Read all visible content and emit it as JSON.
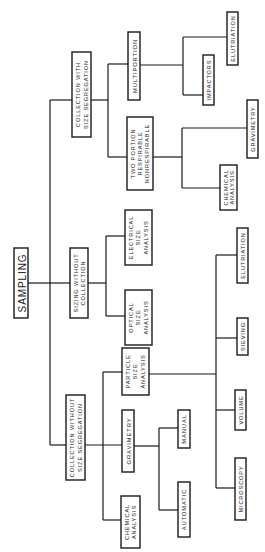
{
  "diagram": {
    "type": "tree",
    "orientation": "rotated-90-ccw",
    "root": "SAMPLING",
    "nodes": {
      "sampling": {
        "lines": [
          "SAMPLING"
        ]
      },
      "coll_with_seg": {
        "lines": [
          "COLLECTION WITH",
          "SIZE SEGREGATION"
        ]
      },
      "sizing_without_coll": {
        "lines": [
          "SIZING WITHOUT",
          "COLLECTION"
        ]
      },
      "coll_without_seg": {
        "lines": [
          "COLLECTION WITHOUT",
          "SIZE SEGREGATION"
        ]
      },
      "multiportion": {
        "lines": [
          "MULTIPORTION"
        ]
      },
      "two_portion": {
        "lines": [
          "TWO PORTION",
          "RESPIRABLE",
          "NONRESPIRABLE"
        ]
      },
      "impactors": {
        "lines": [
          "IMPACTORS"
        ]
      },
      "elutriation_top": {
        "lines": [
          "ELUTRIATION"
        ]
      },
      "gravimetry_right": {
        "lines": [
          "GRAVIMETRY"
        ]
      },
      "chemical_right": {
        "lines": [
          "CHEMICAL",
          "ANALYSIS"
        ]
      },
      "electrical": {
        "lines": [
          "ELECTRICAL",
          "SIZE",
          "ANALYSIS"
        ]
      },
      "optical": {
        "lines": [
          "OPTICAL",
          "SIZE",
          "ANALYSIS"
        ]
      },
      "particle_size": {
        "lines": [
          "PARTICLE",
          "SIZE",
          "ANALYSIS"
        ]
      },
      "gravimetry_left": {
        "lines": [
          "GRAVIMETRY"
        ]
      },
      "chemical_left": {
        "lines": [
          "CHEMICAL",
          "ANALYSIS"
        ]
      },
      "elutriation_low": {
        "lines": [
          "ELUTRIATION"
        ]
      },
      "sieving": {
        "lines": [
          "SIEVING"
        ]
      },
      "volume": {
        "lines": [
          "VOLUME"
        ]
      },
      "microscopy": {
        "lines": [
          "MICROSCOPY"
        ]
      },
      "manual": {
        "lines": [
          "MANUAL"
        ]
      },
      "automatic": {
        "lines": [
          "AUTOMATIC"
        ]
      }
    },
    "edges": [
      [
        "sampling",
        "coll_with_seg"
      ],
      [
        "sampling",
        "sizing_without_coll"
      ],
      [
        "sampling",
        "coll_without_seg"
      ],
      [
        "coll_with_seg",
        "multiportion"
      ],
      [
        "coll_with_seg",
        "two_portion"
      ],
      [
        "multiportion",
        "impactors"
      ],
      [
        "multiportion",
        "elutriation_top"
      ],
      [
        "two_portion",
        "gravimetry_right"
      ],
      [
        "two_portion",
        "chemical_right"
      ],
      [
        "sizing_without_coll",
        "electrical"
      ],
      [
        "sizing_without_coll",
        "optical"
      ],
      [
        "coll_without_seg",
        "particle_size"
      ],
      [
        "coll_without_seg",
        "gravimetry_left"
      ],
      [
        "coll_without_seg",
        "chemical_left"
      ],
      [
        "particle_size",
        "elutriation_low"
      ],
      [
        "particle_size",
        "sieving"
      ],
      [
        "particle_size",
        "volume"
      ],
      [
        "particle_size",
        "microscopy"
      ],
      [
        "gravimetry_left",
        "manual"
      ],
      [
        "gravimetry_left",
        "automatic"
      ]
    ]
  }
}
